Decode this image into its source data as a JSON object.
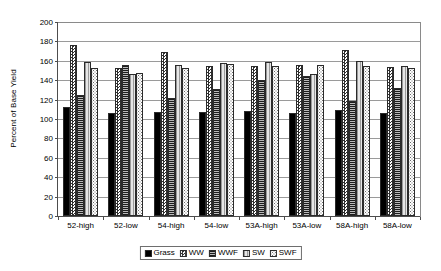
{
  "chart_data": {
    "type": "bar",
    "title": "",
    "xlabel": "",
    "ylabel": "Percent of Base Yield",
    "ylim": [
      0,
      200
    ],
    "yticks": [
      0,
      20,
      40,
      60,
      80,
      100,
      120,
      140,
      160,
      180,
      200
    ],
    "grid": true,
    "legend_position": "bottom",
    "categories": [
      "52-high",
      "52-low",
      "54-high",
      "54-low",
      "53A-high",
      "53A-low",
      "58A-high",
      "58A-low"
    ],
    "series": [
      {
        "name": "Grass",
        "pattern": "solid-black",
        "values": [
          112,
          106,
          107,
          107,
          108,
          106,
          109,
          106
        ]
      },
      {
        "name": "WW",
        "pattern": "checkerboard",
        "values": [
          176,
          153,
          169,
          155,
          155,
          156,
          171,
          154
        ]
      },
      {
        "name": "WWF",
        "pattern": "horizontal-lines",
        "values": [
          125,
          156,
          122,
          131,
          140,
          144,
          119,
          132
        ]
      },
      {
        "name": "SW",
        "pattern": "light-vertical",
        "values": [
          159,
          146,
          156,
          158,
          159,
          146,
          160,
          155
        ]
      },
      {
        "name": "SWF",
        "pattern": "dotted",
        "values": [
          153,
          147,
          153,
          157,
          155,
          156,
          155,
          153
        ]
      }
    ]
  },
  "legend": {
    "items": [
      {
        "label": "Grass"
      },
      {
        "label": "WW"
      },
      {
        "label": "WWF"
      },
      {
        "label": "SW"
      },
      {
        "label": "SWF"
      }
    ]
  },
  "colors": {
    "axis": "#4d4d4d",
    "gridline": "#9a9a9a",
    "background": "#ffffff",
    "grass": "#000000",
    "ww": "#2f2f2f",
    "wwf": "#8c8c8c",
    "sw": "#d2d2d2",
    "swf": "#6e6e6e"
  }
}
